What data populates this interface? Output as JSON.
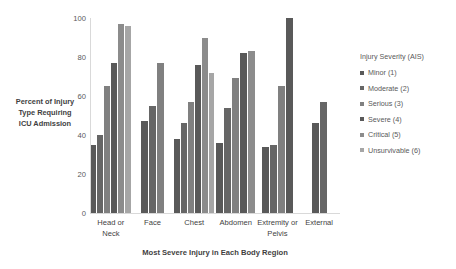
{
  "chart_data": {
    "type": "bar",
    "title": "",
    "xlabel": "Most Severe Injury in Each Body Region",
    "ylabel": "Percent of Injury Type Requiring ICU Admission",
    "ylabel_lines": [
      "Percent of Injury",
      "Type Requiring",
      "ICU Admission"
    ],
    "ylim": [
      0,
      100
    ],
    "yticks": [
      0,
      20,
      40,
      60,
      80,
      100
    ],
    "ytick_labels": [
      "0",
      "20",
      "40",
      "60",
      "80",
      "100"
    ],
    "grid": false,
    "legend_position": "right",
    "legend_title": "Injury Severity (AIS)",
    "categories": [
      "Head or Neck",
      "Face",
      "Chest",
      "Abdomen",
      "Extremity or Pelvis",
      "External"
    ],
    "category_label_lines": [
      [
        "Head or Neck"
      ],
      [
        "Face"
      ],
      [
        "Chest"
      ],
      [
        "Abdomen"
      ],
      [
        "Extremity or",
        "Pelvis"
      ],
      [
        "External"
      ]
    ],
    "series": [
      {
        "name": "Minor (1)",
        "color": "#595959",
        "values": [
          35,
          47,
          38,
          36,
          34,
          46
        ]
      },
      {
        "name": "Moderate (2)",
        "color": "#666666",
        "values": [
          40,
          55,
          46,
          54,
          35,
          57
        ]
      },
      {
        "name": "Serious (3)",
        "color": "#808080",
        "values": [
          65,
          77,
          57,
          69,
          65,
          null
        ]
      },
      {
        "name": "Severe (4)",
        "color": "#595959",
        "values": [
          77,
          null,
          76,
          82,
          100,
          null
        ]
      },
      {
        "name": "Critical (5)",
        "color": "#8c8c8c",
        "values": [
          97,
          null,
          90,
          83,
          null,
          null
        ]
      },
      {
        "name": "Unsurvivable (6)",
        "color": "#a6a6a6",
        "values": [
          96,
          null,
          72,
          null,
          null,
          null
        ]
      }
    ]
  },
  "legend": {
    "title": "Injury Severity (AIS)",
    "items": [
      {
        "label": "Minor (1)",
        "color": "#595959"
      },
      {
        "label": "Moderate (2)",
        "color": "#666666"
      },
      {
        "label": "Serious (3)",
        "color": "#808080"
      },
      {
        "label": "Severe (4)",
        "color": "#595959"
      },
      {
        "label": "Critical (5)",
        "color": "#8c8c8c"
      },
      {
        "label": "Unsurvivable (6)",
        "color": "#a6a6a6"
      }
    ]
  },
  "axes": {
    "y_title_lines": [
      "Percent of Injury",
      "Type Requiring",
      "ICU Admission"
    ],
    "x_title": "Most Severe Injury in Each Body Region"
  },
  "colors": {
    "axis": "#d9d9d9",
    "text": "#3f3f3f",
    "tick_text": "#595959",
    "background": "#ffffff"
  }
}
